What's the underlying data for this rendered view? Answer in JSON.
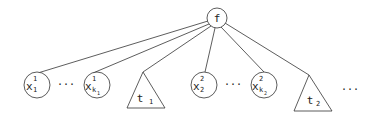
{
  "root": {
    "label": "f"
  },
  "leaves": [
    {
      "type": "var",
      "base": "x",
      "sup": "1",
      "sub": "1"
    },
    {
      "type": "dots",
      "label": "···"
    },
    {
      "type": "var",
      "base": "x",
      "sup": "1",
      "sub": "k",
      "subsub": "1"
    },
    {
      "type": "subtree",
      "label": "t",
      "sub": "1"
    },
    {
      "type": "var",
      "base": "x",
      "sup": "2",
      "sub": "2"
    },
    {
      "type": "dots",
      "label": "···"
    },
    {
      "type": "var",
      "base": "x",
      "sup": "2",
      "sub": "k",
      "subsub": "2"
    },
    {
      "type": "subtree",
      "label": "t",
      "sub": "2"
    },
    {
      "type": "dots",
      "label": "···"
    }
  ]
}
